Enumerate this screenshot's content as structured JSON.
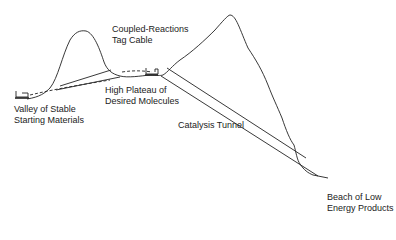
{
  "diagram": {
    "labels": {
      "cable_line1": "Coupled-Reactions",
      "cable_line2": "Tag Cable",
      "valley_line1": "Valley of Stable",
      "valley_line2": "Starting Materials",
      "plateau_line1": "High Plateau of",
      "plateau_line2": "Desired Molecules",
      "tunnel": "Catalysis Tunnel",
      "beach_line1": "Beach of Low",
      "beach_line2": "Energy Products"
    },
    "icons": [
      "cart-icon-valley",
      "cart-icon-plateau"
    ],
    "colors": {
      "line": "#222222",
      "background": "#ffffff"
    }
  }
}
